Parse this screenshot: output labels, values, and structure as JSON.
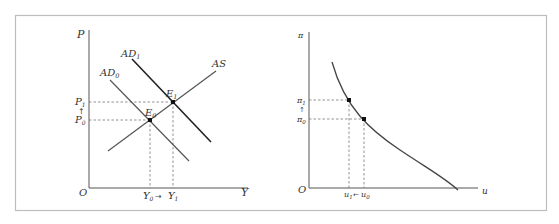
{
  "figure": {
    "frame": {
      "x": 15,
      "y": 15,
      "width": 531,
      "height": 196,
      "stroke": "#bdbdbd"
    },
    "colors": {
      "axis": "#555555",
      "curve_dark": "#222222",
      "curve_mid": "#555555",
      "dash": "#777777",
      "point": "#111111",
      "text": "#333333"
    }
  },
  "left_panel": {
    "title": "AD-AS model",
    "axes": {
      "y_label": "P",
      "x_label": "Y",
      "origin_label": "O"
    },
    "curves": [
      {
        "name": "AD0",
        "label": "AD",
        "sub": "0"
      },
      {
        "name": "AD1",
        "label": "AD",
        "sub": "1"
      },
      {
        "name": "AS",
        "label": "AS",
        "sub": ""
      }
    ],
    "points": [
      {
        "name": "E0",
        "label": "E",
        "sub": "0"
      },
      {
        "name": "E1",
        "label": "E",
        "sub": "1"
      }
    ],
    "y_ticks": [
      {
        "label": "P",
        "sub": "1"
      },
      {
        "label": "P",
        "sub": "0"
      }
    ],
    "y_arrow": "↑",
    "x_ticks": [
      {
        "label": "Y",
        "sub": "0"
      },
      {
        "label": "Y",
        "sub": "1"
      }
    ],
    "x_arrow": "→"
  },
  "right_panel": {
    "title": "Phillips curve",
    "axes": {
      "y_label": "π",
      "x_label": "u",
      "origin_label": "O"
    },
    "y_ticks": [
      {
        "label": "π",
        "sub": "1"
      },
      {
        "label": "π",
        "sub": "0"
      }
    ],
    "y_arrow": "↑",
    "x_ticks": [
      {
        "label": "u",
        "sub": "1"
      },
      {
        "label": "u",
        "sub": "0"
      }
    ],
    "x_arrow": "←"
  }
}
